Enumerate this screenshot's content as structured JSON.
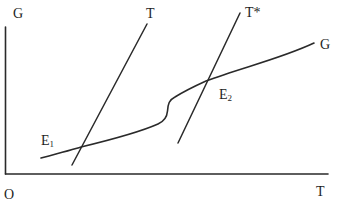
{
  "diagram": {
    "type": "economic-equilibrium-diagram",
    "axes": {
      "y_label": "G",
      "x_label": "T",
      "origin_label": "O"
    },
    "lines": [
      {
        "id": "T",
        "label": "T",
        "from": [
          72,
          165
        ],
        "to": [
          147,
          24
        ]
      },
      {
        "id": "T_star",
        "label": "T*",
        "from": [
          178,
          143
        ],
        "to": [
          240,
          13
        ]
      }
    ],
    "curves": [
      {
        "id": "G",
        "label": "G",
        "description": "upward-sloping curve with S-shaped bend between E1 and E2"
      }
    ],
    "equilibria": [
      {
        "id": "E1",
        "base": "E",
        "sub": "1",
        "point": [
          81,
          147
        ]
      },
      {
        "id": "E2",
        "base": "E",
        "sub": "2",
        "point": [
          206,
          81
        ]
      }
    ],
    "colors": {
      "stroke": "#2a2a2a",
      "text": "#1e1e1e",
      "background": "#ffffff"
    }
  }
}
